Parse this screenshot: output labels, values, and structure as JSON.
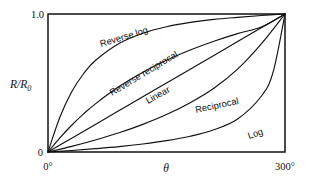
{
  "chart_data": {
    "type": "line",
    "title": "",
    "subtitle": "",
    "xlabel": "θ",
    "ylabel": "R/R0",
    "ylabel_parts": {
      "main": "R/R",
      "sub": "0"
    },
    "xlim": [
      0,
      300
    ],
    "ylim": [
      0,
      1.0
    ],
    "x_tick_labels": [
      "0°",
      "300°"
    ],
    "y_tick_labels": [
      "0",
      "1.0"
    ],
    "grid": false,
    "legend": "inline-curve-labels",
    "annotations": [
      {
        "text": "Reverse log",
        "rotation": -18
      },
      {
        "text": "Reverse reciprocal",
        "rotation": -30
      },
      {
        "text": "Linear",
        "rotation": -28
      },
      {
        "text": "Reciprocal",
        "rotation": -13
      },
      {
        "text": "Log",
        "rotation": -22
      }
    ],
    "series": [
      {
        "name": "Reverse log",
        "x": [
          0,
          15,
          30,
          45,
          60,
          90,
          120,
          150,
          180,
          210,
          240,
          270,
          300
        ],
        "y": [
          0.0,
          0.252,
          0.437,
          0.567,
          0.663,
          0.786,
          0.861,
          0.908,
          0.939,
          0.961,
          0.976,
          0.989,
          1.0
        ]
      },
      {
        "name": "Reverse reciprocal",
        "x": [
          0,
          15,
          30,
          45,
          60,
          90,
          120,
          150,
          180,
          210,
          240,
          270,
          300
        ],
        "y": [
          0.0,
          0.103,
          0.194,
          0.276,
          0.349,
          0.474,
          0.578,
          0.665,
          0.739,
          0.803,
          0.858,
          0.906,
          1.0
        ]
      },
      {
        "name": "Linear",
        "x": [
          0,
          30,
          60,
          90,
          120,
          150,
          180,
          210,
          240,
          270,
          300
        ],
        "y": [
          0.0,
          0.1,
          0.2,
          0.3,
          0.4,
          0.5,
          0.6,
          0.7,
          0.8,
          0.9,
          1.0
        ]
      },
      {
        "name": "Reciprocal",
        "x": [
          0,
          30,
          60,
          90,
          120,
          150,
          180,
          210,
          240,
          270,
          300
        ],
        "y": [
          0.0,
          0.041,
          0.087,
          0.139,
          0.2,
          0.271,
          0.357,
          0.462,
          0.6,
          0.783,
          1.0
        ]
      },
      {
        "name": "Log",
        "x": [
          0,
          30,
          60,
          90,
          120,
          150,
          180,
          210,
          240,
          270,
          285,
          300
        ],
        "y": [
          0.0,
          0.011,
          0.024,
          0.039,
          0.058,
          0.082,
          0.114,
          0.161,
          0.239,
          0.404,
          0.58,
          1.0
        ]
      }
    ]
  },
  "axes": {
    "y_top_label": "1.0",
    "y_bottom_label": "0",
    "y_axis_title_main": "R/R",
    "y_axis_title_sub": "0",
    "x_left_label": "0°",
    "x_right_label": "300°",
    "x_axis_title": "θ"
  },
  "curve_labels": {
    "reverse_log": "Reverse log",
    "reverse_reciprocal": "Reverse reciprocal",
    "linear": "Linear",
    "reciprocal": "Reciprocal",
    "log": "Log"
  },
  "colors": {
    "ink": "#111111",
    "background": "#ffffff"
  }
}
